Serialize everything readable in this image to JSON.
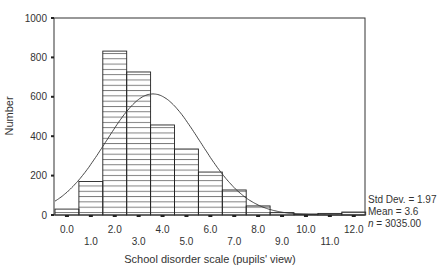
{
  "chart_data": {
    "type": "bar",
    "subtype": "histogram_with_normal_curve",
    "title": "",
    "xlabel": "School disorder scale (pupils' view)",
    "ylabel": "Number",
    "ylim": [
      0,
      1000
    ],
    "y_ticks": [
      0,
      200,
      400,
      600,
      800,
      1000
    ],
    "x_ticks_upper": [
      "0.0",
      "2.0",
      "4.0",
      "6.0",
      "8.0",
      "10.0",
      "12.0"
    ],
    "x_ticks_lower": [
      "1.0",
      "3.0",
      "5.0",
      "7.0",
      "9.0",
      "11.0"
    ],
    "categories": [
      "0.0",
      "1.0",
      "2.0",
      "3.0",
      "4.0",
      "5.0",
      "6.0",
      "7.0",
      "8.0",
      "9.0",
      "10.0",
      "11.0",
      "12.0"
    ],
    "values": [
      30,
      170,
      832,
      726,
      457,
      335,
      218,
      127,
      46,
      12,
      5,
      8,
      15
    ],
    "normal_curve": {
      "mean": 3.6,
      "std_dev": 1.97,
      "n": 3035
    },
    "grid": false,
    "bar_fill": "horizontal-hatch",
    "legend": null,
    "stats_box": {
      "std_dev": "Std Dev. = 1.97",
      "mean": "Mean = 3.6",
      "n_label": "n",
      "n_value": " = 3035.00"
    }
  }
}
